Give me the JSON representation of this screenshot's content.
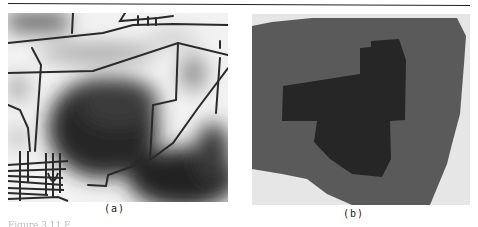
{
  "figure": {
    "panels": [
      {
        "id": "a",
        "label": "(a)",
        "description": "Grayscale distance field around road network (white near roads, dark far away)"
      },
      {
        "id": "b",
        "label": "(b)",
        "description": "Segmented regions: dark core region inside medium-gray region on light background"
      }
    ],
    "caption_partial": "Figure 3.11 F",
    "colors": {
      "road": "#2a2a2a",
      "far_field": "#2e2e2e",
      "near_field": "#f5f5f5",
      "region_outer": "#5a5a5a",
      "region_inner": "#262626",
      "background_light": "#e6e6e6"
    }
  }
}
